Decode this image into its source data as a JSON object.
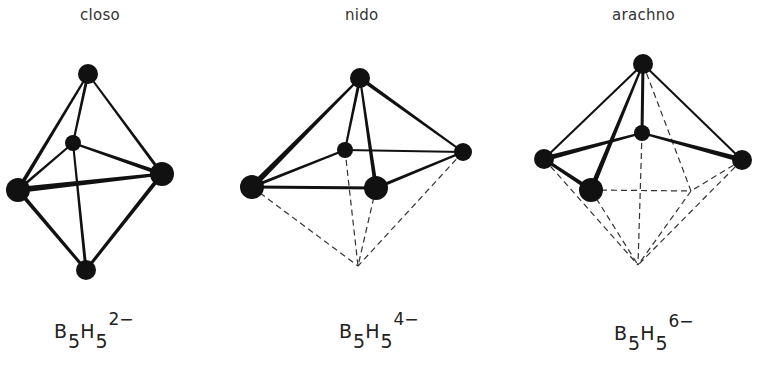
{
  "structures": [
    {
      "id": "closo",
      "title": "closo",
      "title_pos": [
        80,
        6
      ],
      "formula": {
        "element1": "B",
        "sub1": "5",
        "element2": "H",
        "sub2": "5",
        "charge": "2−"
      },
      "formula_pos": [
        54,
        322
      ],
      "atoms": [
        {
          "x": 88,
          "y": 74,
          "r": 10
        },
        {
          "x": 73,
          "y": 143,
          "r": 8
        },
        {
          "x": 18,
          "y": 190,
          "r": 12
        },
        {
          "x": 162,
          "y": 174,
          "r": 12
        },
        {
          "x": 86,
          "y": 270,
          "r": 10
        }
      ],
      "bonds": [
        {
          "a": 0,
          "b": 2,
          "w1": 2,
          "w2": 4
        },
        {
          "a": 0,
          "b": 1,
          "w1": 3,
          "w2": 2
        },
        {
          "a": 0,
          "b": 3,
          "w1": 2,
          "w2": 3
        },
        {
          "a": 1,
          "b": 2,
          "w1": 2,
          "w2": 3
        },
        {
          "a": 1,
          "b": 3,
          "w1": 2,
          "w2": 4
        },
        {
          "a": 1,
          "b": 4,
          "w1": 2,
          "w2": 3
        },
        {
          "a": 2,
          "b": 3,
          "w1": 6,
          "w2": 3
        },
        {
          "a": 2,
          "b": 4,
          "w1": 4,
          "w2": 3
        },
        {
          "a": 3,
          "b": 4,
          "w1": 4,
          "w2": 3
        }
      ],
      "dashed": []
    },
    {
      "id": "nido",
      "title": "nido",
      "title_pos": [
        345,
        6
      ],
      "formula": {
        "element1": "B",
        "sub1": "5",
        "element2": "H",
        "sub2": "5",
        "charge": "4−"
      },
      "formula_pos": [
        339,
        322
      ],
      "atoms": [
        {
          "x": 360,
          "y": 78,
          "r": 10
        },
        {
          "x": 345,
          "y": 150,
          "r": 8
        },
        {
          "x": 463,
          "y": 152,
          "r": 9
        },
        {
          "x": 252,
          "y": 187,
          "r": 12
        },
        {
          "x": 376,
          "y": 188,
          "r": 12
        }
      ],
      "bonds": [
        {
          "a": 0,
          "b": 3,
          "w1": 2,
          "w2": 6
        },
        {
          "a": 0,
          "b": 1,
          "w1": 3,
          "w2": 2
        },
        {
          "a": 0,
          "b": 2,
          "w1": 4,
          "w2": 2
        },
        {
          "a": 0,
          "b": 4,
          "w1": 2,
          "w2": 4
        },
        {
          "a": 1,
          "b": 3,
          "w1": 2,
          "w2": 3
        },
        {
          "a": 1,
          "b": 2,
          "w1": 2,
          "w2": 2
        },
        {
          "a": 3,
          "b": 4,
          "w1": 3,
          "w2": 3
        },
        {
          "a": 4,
          "b": 2,
          "w1": 3,
          "w2": 2
        }
      ],
      "dashed": [
        {
          "x1": 252,
          "y1": 187,
          "x2": 358,
          "y2": 266
        },
        {
          "x1": 345,
          "y1": 150,
          "x2": 358,
          "y2": 266
        },
        {
          "x1": 376,
          "y1": 188,
          "x2": 358,
          "y2": 266
        },
        {
          "x1": 463,
          "y1": 152,
          "x2": 358,
          "y2": 266
        }
      ]
    },
    {
      "id": "arachno",
      "title": "arachno",
      "title_pos": [
        612,
        6
      ],
      "formula": {
        "element1": "B",
        "sub1": "5",
        "element2": "H",
        "sub2": "5",
        "charge": "6−"
      },
      "formula_pos": [
        614,
        324
      ],
      "atoms": [
        {
          "x": 643,
          "y": 64,
          "r": 10
        },
        {
          "x": 642,
          "y": 133,
          "r": 8
        },
        {
          "x": 544,
          "y": 159,
          "r": 10
        },
        {
          "x": 742,
          "y": 160,
          "r": 10
        },
        {
          "x": 591,
          "y": 190,
          "r": 12
        }
      ],
      "bonds": [
        {
          "a": 0,
          "b": 2,
          "w1": 2,
          "w2": 2
        },
        {
          "a": 0,
          "b": 1,
          "w1": 3,
          "w2": 3
        },
        {
          "a": 0,
          "b": 3,
          "w1": 2,
          "w2": 2
        },
        {
          "a": 0,
          "b": 4,
          "w1": 2,
          "w2": 5
        },
        {
          "a": 1,
          "b": 2,
          "w1": 2,
          "w2": 5
        },
        {
          "a": 1,
          "b": 3,
          "w1": 2,
          "w2": 5
        },
        {
          "a": 2,
          "b": 4,
          "w1": 3,
          "w2": 4
        }
      ],
      "dashed": [
        {
          "x1": 643,
          "y1": 64,
          "x2": 691,
          "y2": 191
        },
        {
          "x1": 591,
          "y1": 190,
          "x2": 691,
          "y2": 191
        },
        {
          "x1": 742,
          "y1": 160,
          "x2": 691,
          "y2": 191
        },
        {
          "x1": 642,
          "y1": 133,
          "x2": 638,
          "y2": 265
        },
        {
          "x1": 544,
          "y1": 159,
          "x2": 638,
          "y2": 265
        },
        {
          "x1": 591,
          "y1": 190,
          "x2": 638,
          "y2": 265
        },
        {
          "x1": 742,
          "y1": 160,
          "x2": 638,
          "y2": 265
        },
        {
          "x1": 691,
          "y1": 191,
          "x2": 638,
          "y2": 265
        }
      ]
    }
  ],
  "colors": {
    "ink": "#111111",
    "dash": "#333333",
    "text": "#333333"
  }
}
